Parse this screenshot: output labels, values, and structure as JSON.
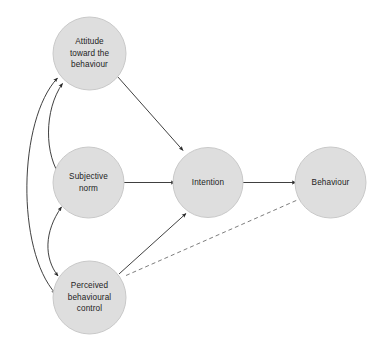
{
  "diagram": {
    "type": "path-diagram",
    "canvas": {
      "width": 381,
      "height": 345,
      "background": "#ffffff"
    },
    "style": {
      "node_fill": "#dedede",
      "node_stroke": "#c9c9c9",
      "edge_color": "#2a2a2a",
      "dashed_edge_color": "#6e6e6e",
      "label_color": "#1d1d1d"
    },
    "nodes": [
      {
        "id": "attitude",
        "lines": [
          "Attitude",
          "toward the",
          "behaviour"
        ],
        "cx": 89.5,
        "cy": 53.5,
        "r": 36.5
      },
      {
        "id": "subjective_norm",
        "lines": [
          "Subjective",
          "norm"
        ],
        "cx": 88.5,
        "cy": 182.5,
        "r": 35.5
      },
      {
        "id": "perceived_behavioural_control",
        "lines": [
          "Perceived",
          "behavioural",
          "control"
        ],
        "cx": 89.5,
        "cy": 297.5,
        "r": 36.5
      },
      {
        "id": "intention",
        "lines": [
          "Intention"
        ],
        "cx": 208.0,
        "cy": 182.5,
        "r": 35.0
      },
      {
        "id": "behaviour",
        "lines": [
          "Behaviour"
        ],
        "cx": 330.5,
        "cy": 182.5,
        "r": 35.5
      }
    ],
    "edges": [
      {
        "id": "attitude-to-intention",
        "from": "attitude",
        "to": "intention",
        "style": "solid",
        "arrows": "single"
      },
      {
        "id": "subjective-norm-to-intention",
        "from": "subjective_norm",
        "to": "intention",
        "style": "solid",
        "arrows": "single"
      },
      {
        "id": "pbc-to-intention",
        "from": "perceived_behavioural_control",
        "to": "intention",
        "style": "solid",
        "arrows": "single"
      },
      {
        "id": "intention-to-behaviour",
        "from": "intention",
        "to": "behaviour",
        "style": "solid",
        "arrows": "single"
      },
      {
        "id": "pbc-to-behaviour",
        "from": "perceived_behavioural_control",
        "to": "behaviour",
        "style": "dashed",
        "arrows": "single"
      },
      {
        "id": "attitude-subjective-norm",
        "from": "attitude",
        "to": "subjective_norm",
        "style": "curved",
        "arrows": "double"
      },
      {
        "id": "subjective-norm-pbc",
        "from": "subjective_norm",
        "to": "perceived_behavioural_control",
        "style": "curved",
        "arrows": "double"
      },
      {
        "id": "attitude-pbc",
        "from": "attitude",
        "to": "perceived_behavioural_control",
        "style": "curved",
        "arrows": "double"
      }
    ]
  }
}
